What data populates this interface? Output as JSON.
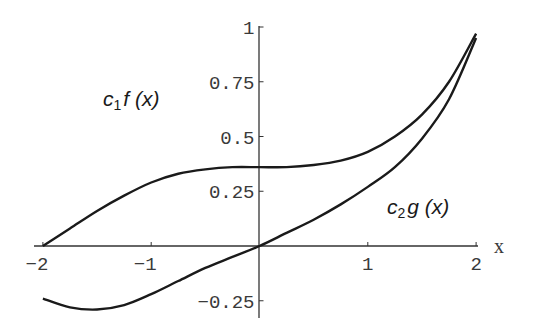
{
  "chart_data": {
    "type": "line",
    "title": "",
    "xlabel": "x",
    "ylabel": "",
    "xlim": [
      -2.05,
      2.05
    ],
    "ylim": [
      -0.3,
      1.0
    ],
    "grid": false,
    "legend": "inline labels",
    "x_ticks": [
      -2,
      -1,
      1,
      2
    ],
    "x_tick_labels": [
      "-2",
      "-1",
      "1",
      "2"
    ],
    "y_ticks": [
      -0.25,
      0.25,
      0.5,
      0.75,
      1
    ],
    "y_tick_labels": [
      "-0.25",
      "0.25",
      "0.5",
      "0.75",
      "1"
    ],
    "series": [
      {
        "name": "c1 f(x)",
        "label_main": "c",
        "label_sub": "1",
        "label_rest": "f (x)",
        "x": [
          -2.0,
          -1.75,
          -1.5,
          -1.25,
          -1.0,
          -0.75,
          -0.5,
          -0.25,
          0.0,
          0.25,
          0.5,
          0.75,
          1.0,
          1.25,
          1.5,
          1.75,
          2.0
        ],
        "values": [
          0.0,
          0.08,
          0.16,
          0.23,
          0.29,
          0.33,
          0.35,
          0.36,
          0.36,
          0.36,
          0.37,
          0.39,
          0.43,
          0.5,
          0.6,
          0.75,
          0.97
        ]
      },
      {
        "name": "c2 g(x)",
        "label_main": "c",
        "label_sub": "2",
        "label_rest": "g (x)",
        "x": [
          -2.0,
          -1.75,
          -1.5,
          -1.25,
          -1.0,
          -0.75,
          -0.5,
          -0.25,
          0.0,
          0.25,
          0.5,
          0.75,
          1.0,
          1.25,
          1.5,
          1.75,
          2.0
        ],
        "values": [
          -0.24,
          -0.28,
          -0.29,
          -0.27,
          -0.22,
          -0.16,
          -0.1,
          -0.05,
          0.0,
          0.06,
          0.12,
          0.19,
          0.27,
          0.36,
          0.49,
          0.67,
          0.95
        ]
      }
    ],
    "annotations": [
      {
        "text": "c1 f (x)",
        "x": -1.6,
        "y": 0.5
      },
      {
        "text": "c2 g (x)",
        "x": 1.2,
        "y": 0.13
      }
    ]
  }
}
